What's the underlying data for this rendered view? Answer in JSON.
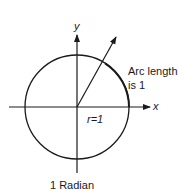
{
  "diagram": {
    "title": "1 Radian",
    "axis_x_label": "x",
    "axis_y_label": "y",
    "radius_label": "r=1",
    "arc_label_line1": "Arc length",
    "arc_label_line2": "is 1",
    "colors": {
      "stroke": "#1a1a1a",
      "background": "#ffffff"
    }
  }
}
